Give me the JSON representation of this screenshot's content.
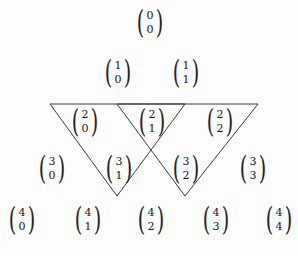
{
  "figure": {
    "width": 298,
    "height": 256,
    "background_color": "#fdfdfd",
    "line_color": "#3a3a3a",
    "text_color": "#171717"
  },
  "chart_data": {
    "type": "diagram",
    "title": "",
    "rows": [
      {
        "row": 0,
        "y": 23,
        "entries": [
          {
            "n": "0",
            "k": "0",
            "x": 150,
            "label": "C(0,0)"
          }
        ]
      },
      {
        "row": 1,
        "y": 73,
        "entries": [
          {
            "n": "1",
            "k": "0",
            "x": 118,
            "label": "C(1,0)"
          },
          {
            "n": "1",
            "k": "1",
            "x": 186,
            "label": "C(1,1)"
          }
        ]
      },
      {
        "row": 2,
        "y": 122,
        "entries": [
          {
            "n": "2",
            "k": "0",
            "x": 85,
            "label": "C(2,0)"
          },
          {
            "n": "2",
            "k": "1",
            "x": 152,
            "label": "C(2,1)"
          },
          {
            "n": "2",
            "k": "2",
            "x": 220,
            "label": "C(2,2)"
          }
        ]
      },
      {
        "row": 3,
        "y": 169,
        "entries": [
          {
            "n": "3",
            "k": "0",
            "x": 52,
            "label": "C(3,0)"
          },
          {
            "n": "3",
            "k": "1",
            "x": 119,
            "label": "C(3,1)"
          },
          {
            "n": "3",
            "k": "2",
            "x": 186,
            "label": "C(3,2)"
          },
          {
            "n": "3",
            "k": "3",
            "x": 253,
            "label": "C(3,3)"
          }
        ]
      },
      {
        "row": 4,
        "y": 220,
        "entries": [
          {
            "n": "4",
            "k": "0",
            "x": 22,
            "label": "C(4,0)"
          },
          {
            "n": "4",
            "k": "1",
            "x": 88,
            "label": "C(4,1)"
          },
          {
            "n": "4",
            "k": "2",
            "x": 151,
            "label": "C(4,2)"
          },
          {
            "n": "4",
            "k": "3",
            "x": 216,
            "label": "C(4,3)"
          },
          {
            "n": "4",
            "k": "4",
            "x": 279,
            "label": "C(4,4)"
          }
        ]
      }
    ],
    "triangles": [
      {
        "name": "left-triangle",
        "points": "50,104 185,104 117,196",
        "vertices": [
          [
            50,
            104
          ],
          [
            185,
            104
          ],
          [
            117,
            196
          ]
        ]
      },
      {
        "name": "right-triangle",
        "points": "117,104 258,104 185,196",
        "vertices": [
          [
            117,
            104
          ],
          [
            258,
            104
          ],
          [
            185,
            196
          ]
        ]
      }
    ],
    "paren_left": "(",
    "paren_right": ")"
  }
}
